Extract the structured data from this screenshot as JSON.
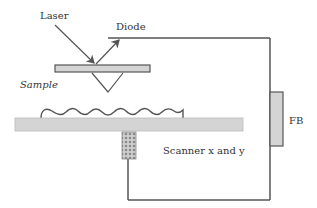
{
  "diagram": {
    "labels": {
      "laser": "Laser",
      "diode": "Diode",
      "sample": "Sample",
      "feedback": "FB",
      "scanner": "Scanner x and y"
    },
    "colors": {
      "line": "#555555",
      "fill_gray": "#d4d4d4",
      "text": "#333333"
    }
  }
}
